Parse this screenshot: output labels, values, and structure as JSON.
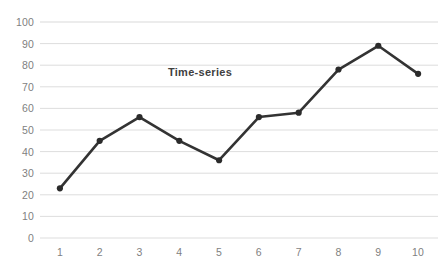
{
  "chart_data": {
    "type": "line",
    "title": "Time-series",
    "xlabel": "",
    "ylabel": "",
    "categories": [
      "1",
      "2",
      "3",
      "4",
      "5",
      "6",
      "7",
      "8",
      "9",
      "10"
    ],
    "values": [
      23,
      45,
      56,
      45,
      36,
      56,
      58,
      78,
      89,
      76
    ],
    "series": [
      {
        "name": "Time-series",
        "values": [
          23,
          45,
          56,
          45,
          36,
          56,
          58,
          78,
          89,
          76
        ]
      }
    ],
    "ylim": [
      0,
      100
    ],
    "y_ticks": [
      0,
      10,
      20,
      30,
      40,
      50,
      60,
      70,
      80,
      90,
      100
    ],
    "y_tick_labels": [
      "0",
      "10",
      "20",
      "30",
      "40",
      "50",
      "60",
      "70",
      "80",
      "90",
      "100"
    ],
    "grid": true,
    "grid_axis": "y",
    "legend": false,
    "legend_position": "none",
    "markers": true,
    "marker_shape": "circle",
    "colors": {
      "line": "#333333",
      "marker": "#2b2b2b",
      "grid": "#d9d9d9",
      "background": "#ffffff",
      "tick_label": "#7f7f7f",
      "title": "#3f3f3f"
    }
  }
}
